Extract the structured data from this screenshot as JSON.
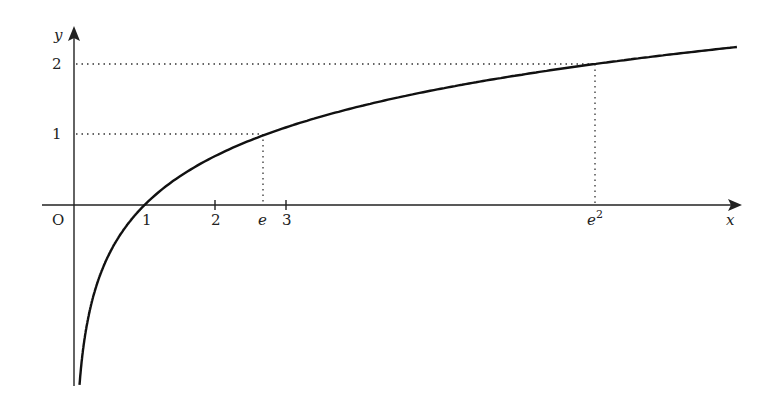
{
  "chart_data": {
    "type": "line",
    "title": "",
    "function": "y = ln x",
    "xlabel": "x",
    "ylabel": "y",
    "origin_label": "O",
    "x_ticks": [
      {
        "value": 1,
        "label": "1"
      },
      {
        "value": 2,
        "label": "2"
      },
      {
        "value": 2.718,
        "label": "e"
      },
      {
        "value": 3,
        "label": "3"
      },
      {
        "value": 7.389,
        "label": "e^2"
      }
    ],
    "y_ticks": [
      {
        "value": 1,
        "label": "1"
      },
      {
        "value": 2,
        "label": "2"
      }
    ],
    "guides": [
      {
        "x": 2.718,
        "y": 1,
        "style": "dotted"
      },
      {
        "x": 7.389,
        "y": 2,
        "style": "dotted"
      }
    ],
    "x_range": [
      -0.45,
      9.5
    ],
    "y_range": [
      -2.5,
      2.4
    ],
    "series": [
      {
        "name": "ln x",
        "x": [
          0.08,
          0.2,
          0.5,
          1,
          2,
          2.718,
          3,
          5,
          7.389,
          9.4
        ],
        "values": [
          -2.53,
          -1.61,
          -0.69,
          0,
          0.69,
          1,
          1.1,
          1.61,
          2,
          2.24
        ]
      }
    ],
    "grid": false,
    "legend": null
  },
  "labels": {
    "y_axis": "y",
    "x_axis": "x",
    "origin": "O",
    "tick_1": "1",
    "tick_2": "2",
    "tick_e": "e",
    "tick_3": "3",
    "tick_e2_base": "e",
    "tick_e2_exp": "2",
    "ytick_1": "1",
    "ytick_2": "2"
  }
}
